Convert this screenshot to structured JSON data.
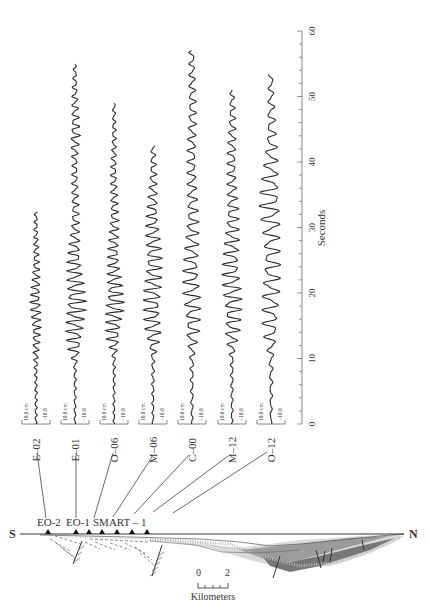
{
  "chart_data": {
    "type": "line",
    "title": "",
    "xlabel": "Seconds",
    "ylabel": "",
    "time_axis": {
      "min": 0,
      "max": 60,
      "major_ticks": [
        0,
        10,
        20,
        30,
        40,
        50,
        60
      ],
      "minor_step": 2,
      "label": "Seconds"
    },
    "amplitude_scale": {
      "top_label": "10.0 cm",
      "bottom_label": "−10.0"
    },
    "series": [
      {
        "name": "E–02",
        "duration_s": 32.5,
        "amp_profile": [
          [
            0,
            0.08
          ],
          [
            8,
            0.1
          ],
          [
            12,
            0.25
          ],
          [
            18,
            0.4
          ],
          [
            22,
            0.3
          ],
          [
            26,
            0.2
          ],
          [
            32.5,
            0.1
          ]
        ],
        "freq": 0.9
      },
      {
        "name": "E–01",
        "duration_s": 55,
        "amp_profile": [
          [
            0,
            0.06
          ],
          [
            9,
            0.1
          ],
          [
            12,
            0.55
          ],
          [
            18,
            0.75
          ],
          [
            24,
            0.55
          ],
          [
            30,
            0.3
          ],
          [
            40,
            0.2
          ],
          [
            44,
            0.35
          ],
          [
            55,
            0.1
          ]
        ],
        "freq": 0.75
      },
      {
        "name": "O–06",
        "duration_s": 49,
        "amp_profile": [
          [
            0,
            0.06
          ],
          [
            10,
            0.1
          ],
          [
            13,
            0.5
          ],
          [
            18,
            0.7
          ],
          [
            24,
            0.45
          ],
          [
            32,
            0.3
          ],
          [
            40,
            0.2
          ],
          [
            49,
            0.1
          ]
        ],
        "freq": 0.8
      },
      {
        "name": "M–06",
        "duration_s": 42.5,
        "amp_profile": [
          [
            0,
            0.06
          ],
          [
            10,
            0.12
          ],
          [
            14,
            0.6
          ],
          [
            20,
            0.65
          ],
          [
            28,
            0.55
          ],
          [
            36,
            0.3
          ],
          [
            42.5,
            0.15
          ]
        ],
        "freq": 0.7
      },
      {
        "name": "C–00",
        "duration_s": 57,
        "amp_profile": [
          [
            0,
            0.06
          ],
          [
            10,
            0.15
          ],
          [
            14,
            0.5
          ],
          [
            20,
            0.65
          ],
          [
            28,
            0.5
          ],
          [
            36,
            0.35
          ],
          [
            46,
            0.3
          ],
          [
            57,
            0.2
          ]
        ],
        "freq": 0.6
      },
      {
        "name": "M–12",
        "duration_s": 51,
        "amp_profile": [
          [
            0,
            0.06
          ],
          [
            10,
            0.12
          ],
          [
            14,
            0.55
          ],
          [
            20,
            0.7
          ],
          [
            28,
            0.55
          ],
          [
            36,
            0.35
          ],
          [
            44,
            0.3
          ],
          [
            51,
            0.15
          ]
        ],
        "freq": 0.65
      },
      {
        "name": "O–12",
        "duration_s": 53.5,
        "amp_profile": [
          [
            0,
            0.06
          ],
          [
            10,
            0.15
          ],
          [
            14,
            0.55
          ],
          [
            20,
            0.65
          ],
          [
            28,
            0.6
          ],
          [
            34,
            0.8
          ],
          [
            38,
            0.6
          ],
          [
            44,
            0.35
          ],
          [
            53.5,
            0.15
          ]
        ],
        "freq": 0.5
      }
    ],
    "cross_section": {
      "left_label": "S",
      "right_label": "N",
      "station_labels": [
        "EO-2",
        "EO-1",
        "SMART – 1"
      ],
      "scale_bar": {
        "start": "0",
        "end": "2",
        "unit": "Kilometers"
      }
    }
  },
  "colors": {
    "trace": "#2a2a2a",
    "axis": "#555555",
    "basin_dark": "#777777",
    "basin_mid": "#a8a8a8",
    "basin_light": "#d6d6d6"
  }
}
